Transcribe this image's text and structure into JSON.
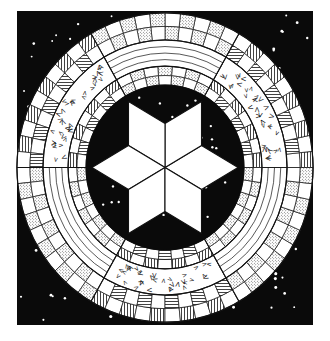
{
  "colors": {
    "background": "#ffffff",
    "field": "#0a0a0a",
    "stars": "#ffffff",
    "paper": "#ffffff",
    "ink": "#111111"
  },
  "field_square": {
    "x": 17,
    "y": 11,
    "width": 296,
    "height": 314
  },
  "medallion": {
    "center": [
      165,
      167.5
    ],
    "scale_y": 1.045,
    "outer_radius": 148,
    "inner_radius": 79,
    "bands": {
      "outer_checker": [
        148,
        135,
        122
      ],
      "middle_band": [
        122,
        97
      ],
      "inner_checker": [
        97,
        88,
        79
      ]
    },
    "cells_per_sector_outer": 10,
    "cells_per_sector_inner": 7,
    "sectors": [
      {
        "from_deg": 0,
        "to_deg": 60,
        "type": "chevron",
        "cell_fill": "hatch"
      },
      {
        "from_deg": 60,
        "to_deg": 120,
        "type": "lines",
        "cell_fill": "stipple"
      },
      {
        "from_deg": 120,
        "to_deg": 180,
        "type": "chevron",
        "cell_fill": "hatch"
      },
      {
        "from_deg": 180,
        "to_deg": 240,
        "type": "lines",
        "cell_fill": "stipple"
      },
      {
        "from_deg": 240,
        "to_deg": 300,
        "type": "chevron",
        "cell_fill": "hatch"
      },
      {
        "from_deg": 300,
        "to_deg": 360,
        "type": "lines",
        "cell_fill": "stipple"
      }
    ],
    "middle_lines_count": 3,
    "chevron_marks": [
      "V",
      "<",
      ">",
      "Λ"
    ]
  },
  "star": {
    "points": 6,
    "radius": 73,
    "point_angles_deg": [
      0,
      60,
      120,
      180,
      240,
      300
    ],
    "fill": "#ffffff"
  },
  "sky_dots": {
    "count_field": 140,
    "count_center": 26,
    "size": 1.3
  }
}
